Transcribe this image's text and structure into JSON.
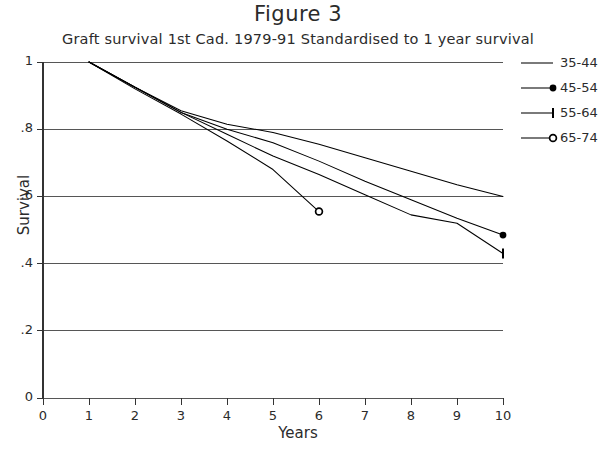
{
  "chart_data": {
    "type": "line",
    "title": "Figure 3",
    "subtitle": "Graft survival 1st Cad. 1979-91  Standardised to 1 year survival",
    "xlabel": "Years",
    "ylabel": "Survival",
    "xlim": [
      0,
      10
    ],
    "ylim": [
      0,
      1
    ],
    "xticks": [
      "0",
      "1",
      "2",
      "3",
      "4",
      "5",
      "6",
      "7",
      "8",
      "9",
      "10"
    ],
    "yticks": [
      "0",
      ".2",
      ".4",
      ".6",
      ".8",
      "1"
    ],
    "grid": "horizontal",
    "legend_position": "top-right",
    "series": [
      {
        "name": "35-44",
        "marker": "none",
        "x": [
          1,
          2,
          3,
          4,
          5,
          6,
          7,
          8,
          9,
          10
        ],
        "y": [
          1.0,
          0.925,
          0.855,
          0.815,
          0.79,
          0.755,
          0.715,
          0.675,
          0.635,
          0.6
        ]
      },
      {
        "name": "45-54",
        "marker": "filled-dot",
        "x": [
          1,
          2,
          3,
          4,
          5,
          6,
          7,
          8,
          9,
          10
        ],
        "y": [
          1.0,
          0.925,
          0.85,
          0.8,
          0.76,
          0.705,
          0.645,
          0.59,
          0.535,
          0.485
        ]
      },
      {
        "name": "55-64",
        "marker": "tick",
        "x": [
          1,
          2,
          3,
          4,
          5,
          6,
          7,
          8,
          9,
          10
        ],
        "y": [
          1.0,
          0.925,
          0.85,
          0.785,
          0.72,
          0.665,
          0.605,
          0.545,
          0.52,
          0.43
        ]
      },
      {
        "name": "65-74",
        "marker": "open-circle",
        "x": [
          1,
          2,
          3,
          4,
          5,
          6
        ],
        "y": [
          1.0,
          0.92,
          0.845,
          0.765,
          0.68,
          0.555
        ]
      }
    ]
  }
}
